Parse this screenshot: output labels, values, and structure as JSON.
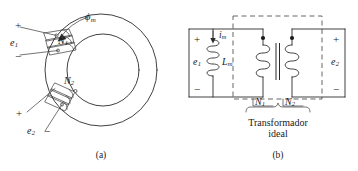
{
  "figure": {
    "background_color": "#ffffff",
    "ink_color": "#1a1a1a",
    "panels": [
      {
        "id": "a",
        "caption": "(a)",
        "type": "toroidal-core-two-windings",
        "labels": {
          "flux": "ϕ",
          "flux_sub": "m",
          "primary_emf": "e",
          "primary_emf_sub": "1",
          "secondary_emf": "e",
          "secondary_emf_sub": "2",
          "primary_turns": "N",
          "primary_turns_sub": "1",
          "secondary_turns": "N",
          "secondary_turns_sub": "2",
          "plus_primary": "+",
          "minus_primary": "−",
          "plus_secondary": "+",
          "minus_secondary": "−"
        }
      },
      {
        "id": "b",
        "caption": "(b)",
        "type": "equivalent-circuit",
        "labels": {
          "primary_emf": "e",
          "primary_emf_sub": "1",
          "secondary_emf": "e",
          "secondary_emf_sub": "2",
          "magnetizing_current": "i",
          "magnetizing_current_sub": "m",
          "magnetizing_inductance": "L",
          "magnetizing_inductance_sub": "m",
          "primary_turns": "N",
          "primary_turns_sub": "1",
          "secondary_turns": "N",
          "secondary_turns_sub": "2",
          "plus_left": "+",
          "minus_left": "−",
          "plus_right": "+",
          "minus_right": "−",
          "ideal_transformer_line1": "Transformador",
          "ideal_transformer_line2": "ideal"
        }
      }
    ]
  }
}
